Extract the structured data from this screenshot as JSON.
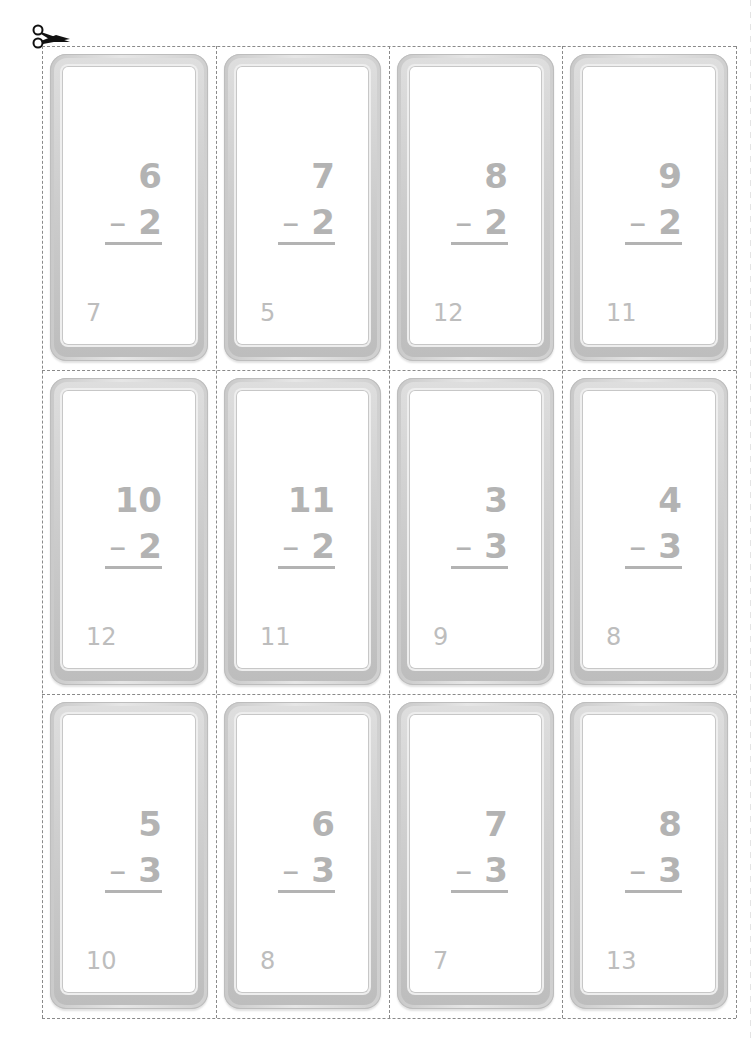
{
  "sheet": {
    "title": "Subtraction flash cards",
    "cut_icon": "scissors-icon",
    "text_color": "#b3b3b3",
    "cards": [
      {
        "top": "6",
        "operator": "–",
        "bottom": "2",
        "corner": "7"
      },
      {
        "top": "7",
        "operator": "–",
        "bottom": "2",
        "corner": "5"
      },
      {
        "top": "8",
        "operator": "–",
        "bottom": "2",
        "corner": "12"
      },
      {
        "top": "9",
        "operator": "–",
        "bottom": "2",
        "corner": "11"
      },
      {
        "top": "10",
        "operator": "–",
        "bottom": "2",
        "corner": "12"
      },
      {
        "top": "11",
        "operator": "–",
        "bottom": "2",
        "corner": "11"
      },
      {
        "top": "3",
        "operator": "–",
        "bottom": "3",
        "corner": "9"
      },
      {
        "top": "4",
        "operator": "–",
        "bottom": "3",
        "corner": "8"
      },
      {
        "top": "5",
        "operator": "–",
        "bottom": "3",
        "corner": "10"
      },
      {
        "top": "6",
        "operator": "–",
        "bottom": "3",
        "corner": "8"
      },
      {
        "top": "7",
        "operator": "–",
        "bottom": "3",
        "corner": "7"
      },
      {
        "top": "8",
        "operator": "–",
        "bottom": "3",
        "corner": "13"
      }
    ]
  }
}
